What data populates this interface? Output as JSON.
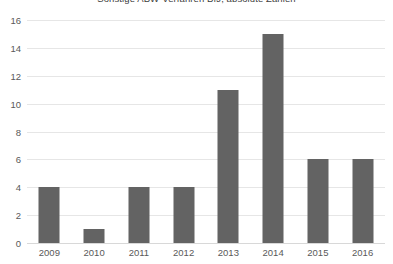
{
  "chart_data": {
    "type": "bar",
    "title": "Sonstige ABW-Verfahren BfJ, absolute Zahlen",
    "xlabel": "",
    "ylabel": "",
    "categories": [
      "2009",
      "2010",
      "2011",
      "2012",
      "2013",
      "2014",
      "2015",
      "2016"
    ],
    "values": [
      4,
      1,
      4,
      4,
      11,
      15,
      6,
      6
    ],
    "ylim": [
      0,
      16
    ],
    "yticks": [
      0,
      2,
      4,
      6,
      8,
      10,
      12,
      14,
      16
    ],
    "ytick_labels": [
      "0",
      "2",
      "4",
      "6",
      "8",
      "10",
      "12",
      "14",
      "16"
    ],
    "grid": true,
    "legend": false,
    "series": [
      {
        "name": "Sonstige ABW-Verfahren BfJ",
        "values": [
          4,
          1,
          4,
          4,
          11,
          15,
          6,
          6
        ],
        "color": "#636363"
      }
    ]
  },
  "colors": {
    "bar": "#636363",
    "gridline": "#e6e6e6",
    "baseline": "#d8d8d8",
    "tick_label": "#595959",
    "title": "#404040",
    "background": "#ffffff"
  }
}
